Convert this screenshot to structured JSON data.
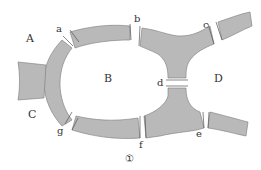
{
  "diagram": {
    "regions": [
      {
        "id": "A",
        "label": "A"
      },
      {
        "id": "B",
        "label": "B"
      },
      {
        "id": "C",
        "label": "C"
      },
      {
        "id": "D",
        "label": "D"
      }
    ],
    "bridges": [
      {
        "id": "a",
        "label": "a"
      },
      {
        "id": "b",
        "label": "b"
      },
      {
        "id": "c",
        "label": "c"
      },
      {
        "id": "d",
        "label": "d"
      },
      {
        "id": "e",
        "label": "e"
      },
      {
        "id": "f",
        "label": "f"
      },
      {
        "id": "g",
        "label": "g"
      }
    ],
    "figure_number": "①",
    "colors": {
      "land_fill": "#b9b9b9",
      "land_edge": "#7a7a7a",
      "text": "#333333"
    }
  }
}
